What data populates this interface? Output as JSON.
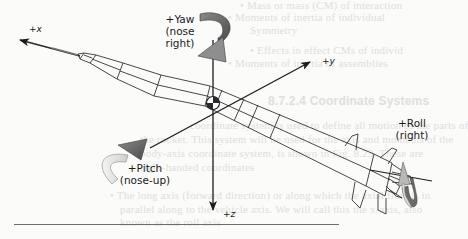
{
  "figure": {
    "type": "rocket body-axis coordinate diagram",
    "axes": {
      "x": {
        "label": "+x"
      },
      "y": {
        "label": "+y"
      },
      "z": {
        "label": "+z"
      }
    },
    "rotations": {
      "yaw": {
        "label_line1": "+Yaw",
        "label_line2": "(nose",
        "label_line3": "right)"
      },
      "pitch": {
        "label_line1": "+Pitch",
        "label_line2": "(nose-up)"
      },
      "roll": {
        "label_line1": "+Roll",
        "label_line2": "(right)"
      }
    },
    "colors": {
      "line": "#2a2a2a",
      "arrow_dark": "#5b5b5b",
      "arrow_light": "#e6e6e2",
      "background": "#fbfbf9"
    }
  },
  "bleed_through_text": {
    "lines": [
      "• Mass or mass (CM) of interaction",
      "• Moments of inertia of individual",
      "    Symmetry",
      "  • Effects in effect CMs of individ",
      "• Moments of inertia of assemblies",
      "8.7.2.4 Coordinate Systems",
      "coordinate system is used to define all motion of the parts of",
      "the rocket. This system will be used for the axis and moments of the",
      "body-axis coordinate system, is shown in Fig. 8.23. These are",
      "right-handed coordinates",
      "• The long axis (forward direction) or along which the axial flow is in",
      "  parallel along to the vehicle axis. We will call this the x-axis, also",
      "  known as the roll axis"
    ]
  }
}
